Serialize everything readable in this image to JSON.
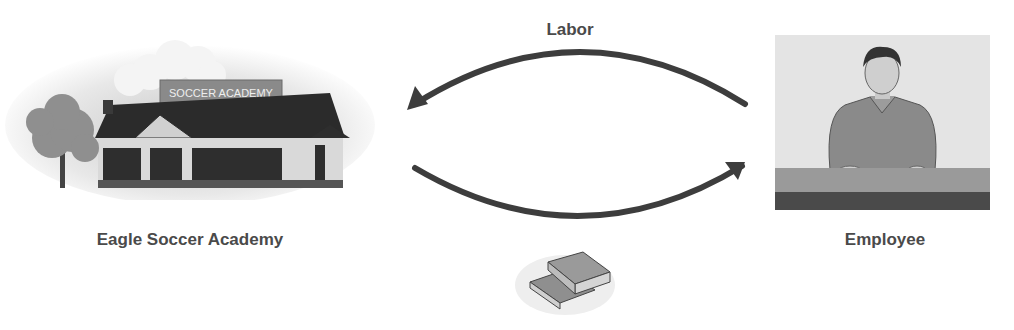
{
  "diagram": {
    "left_entity": {
      "label": "Eagle Soccer Academy",
      "sign_text": "SOCCER ACADEMY",
      "icon": "building-icon"
    },
    "right_entity": {
      "label": "Employee",
      "icon": "employee-icon"
    },
    "top_flow": {
      "label": "Labor",
      "direction": "Employee → Eagle Soccer Academy"
    },
    "bottom_flow": {
      "label_icon": "money-icon",
      "direction": "Eagle Soccer Academy → Employee"
    }
  },
  "colors": {
    "arrow": "#3d3d3d",
    "text": "#4a4a4a",
    "roof": "#2b2b2b",
    "wall": "#d9d9d9"
  }
}
